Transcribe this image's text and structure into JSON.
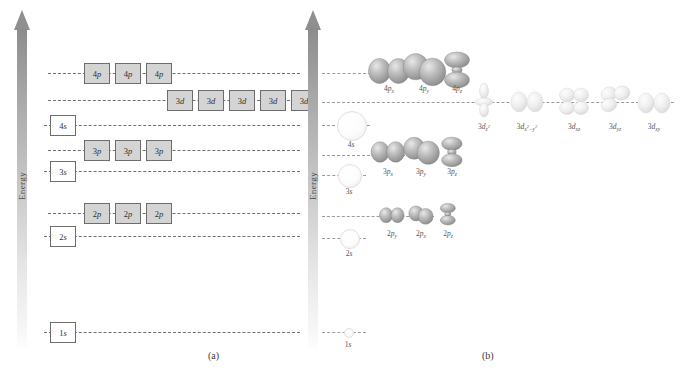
{
  "figure": {
    "panel_a": {
      "caption": "(a)",
      "axis_label": "Energy",
      "levels": [
        {
          "id": "4p",
          "label": "4p",
          "n": "4",
          "l": "p",
          "boxes": 3,
          "filled": true,
          "y": 73,
          "box_start_x": 84,
          "line_x": 48,
          "line_w": 252
        },
        {
          "id": "3d",
          "label": "3d",
          "n": "3",
          "l": "d",
          "boxes": 5,
          "filled": true,
          "y": 100,
          "box_start_x": 167,
          "line_x": 48,
          "line_w": 252
        },
        {
          "id": "4s",
          "label": "4s",
          "n": "4",
          "l": "s",
          "boxes": 1,
          "filled": false,
          "y": 125,
          "box_start_x": 50,
          "line_x": 44,
          "line_w": 256
        },
        {
          "id": "3p",
          "label": "3p",
          "n": "3",
          "l": "p",
          "boxes": 3,
          "filled": true,
          "y": 150,
          "box_start_x": 84,
          "line_x": 48,
          "line_w": 252
        },
        {
          "id": "3s",
          "label": "3s",
          "n": "3",
          "l": "s",
          "boxes": 1,
          "filled": false,
          "y": 171,
          "box_start_x": 50,
          "line_x": 44,
          "line_w": 256
        },
        {
          "id": "2p",
          "label": "2p",
          "n": "2",
          "l": "p",
          "boxes": 3,
          "filled": true,
          "y": 213,
          "box_start_x": 84,
          "line_x": 48,
          "line_w": 252
        },
        {
          "id": "2s",
          "label": "2s",
          "n": "2",
          "l": "s",
          "boxes": 1,
          "filled": false,
          "y": 236,
          "box_start_x": 50,
          "line_x": 44,
          "line_w": 256
        },
        {
          "id": "1s",
          "label": "1s",
          "n": "1",
          "l": "s",
          "boxes": 1,
          "filled": false,
          "y": 332,
          "box_start_x": 50,
          "line_x": 44,
          "line_w": 256
        }
      ]
    },
    "panel_b": {
      "caption": "(b)",
      "axis_label": "Energy",
      "levels": [
        {
          "id": "4p",
          "y": 73,
          "line_x": 322,
          "line_w": 80
        },
        {
          "id": "3d",
          "y": 102,
          "line_x": 322,
          "line_w": 352
        },
        {
          "id": "4s",
          "y": 125,
          "line_x": 322,
          "line_w": 48
        },
        {
          "id": "3p",
          "y": 155,
          "line_x": 322,
          "line_w": 108
        },
        {
          "id": "3s",
          "y": 175,
          "line_x": 322,
          "line_w": 44
        },
        {
          "id": "2p",
          "y": 216,
          "line_x": 322,
          "line_w": 112
        },
        {
          "id": "2s",
          "y": 238,
          "line_x": 322,
          "line_w": 44
        },
        {
          "id": "1s",
          "y": 332,
          "line_x": 322,
          "line_w": 44
        }
      ],
      "s_orbitals": [
        {
          "id": "4s",
          "label": "4s",
          "n": "4",
          "cx": 351,
          "cy": 125,
          "r": 14,
          "label_y": 140
        },
        {
          "id": "3s",
          "label": "3s",
          "n": "3",
          "cx": 349,
          "cy": 175,
          "r": 11,
          "label_y": 187
        },
        {
          "id": "2s",
          "label": "2s",
          "n": "2",
          "cx": 349,
          "cy": 238,
          "r": 9,
          "label_y": 249
        },
        {
          "id": "1s",
          "label": "1s",
          "n": "1",
          "cx": 348,
          "cy": 332,
          "r": 4,
          "label_y": 340
        }
      ],
      "p_orbitals": [
        {
          "id": "4px",
          "n": "4",
          "l": "p",
          "sub": "x",
          "cx": 389,
          "cy": 71,
          "scale": 1.0,
          "shape": "p-horizontal",
          "label_y": 84
        },
        {
          "id": "4py",
          "n": "4",
          "l": "p",
          "sub": "y",
          "cx": 424,
          "cy": 70,
          "scale": 1.05,
          "shape": "p-oblique",
          "label_y": 84
        },
        {
          "id": "4pz",
          "n": "4",
          "l": "p",
          "sub": "z",
          "cx": 457,
          "cy": 70,
          "scale": 1.0,
          "shape": "p-vertical",
          "label_y": 84
        },
        {
          "id": "3px",
          "n": "3",
          "l": "p",
          "sub": "x",
          "cx": 388,
          "cy": 152,
          "scale": 0.82,
          "shape": "p-horizontal",
          "label_y": 167
        },
        {
          "id": "3py",
          "n": "3",
          "l": "p",
          "sub": "y",
          "cx": 421,
          "cy": 151,
          "scale": 0.88,
          "shape": "p-oblique",
          "label_y": 167
        },
        {
          "id": "3pz",
          "n": "3",
          "l": "p",
          "sub": "z",
          "cx": 452,
          "cy": 152,
          "scale": 0.82,
          "shape": "p-vertical",
          "label_y": 167
        },
        {
          "id": "2py",
          "n": "2",
          "l": "p",
          "sub": "y",
          "cx": 392,
          "cy": 215,
          "scale": 0.6,
          "shape": "p-horizontal",
          "label_y": 229
        },
        {
          "id": "2px",
          "n": "2",
          "l": "p",
          "sub": "x",
          "cx": 421,
          "cy": 215,
          "scale": 0.6,
          "shape": "p-oblique",
          "label_y": 229
        },
        {
          "id": "2pz",
          "n": "2",
          "l": "p",
          "sub": "z",
          "cx": 448,
          "cy": 214,
          "scale": 0.6,
          "shape": "p-vertical",
          "label_y": 229
        }
      ],
      "d_orbitals": [
        {
          "id": "3dz2",
          "n": "3",
          "l": "d",
          "sub": "z2",
          "cx": 484,
          "cy": 100,
          "shape": "d-z2",
          "label_y": 122
        },
        {
          "id": "3dx2y2",
          "n": "3",
          "l": "d",
          "sub": "x2-y2",
          "cx": 527,
          "cy": 102,
          "shape": "d-lobes-h",
          "label_y": 122
        },
        {
          "id": "3dxz",
          "n": "3",
          "l": "d",
          "sub": "xz",
          "cx": 574,
          "cy": 102,
          "shape": "d-clover",
          "label_y": 122
        },
        {
          "id": "3dyz",
          "n": "3",
          "l": "d",
          "sub": "yz",
          "cx": 615,
          "cy": 100,
          "shape": "d-clover2",
          "label_y": 122
        },
        {
          "id": "3dxy",
          "n": "3",
          "l": "d",
          "sub": "xy",
          "cx": 654,
          "cy": 103,
          "shape": "d-lobes-h",
          "label_y": 122
        }
      ]
    }
  },
  "colors": {
    "line": "#6f6f6f",
    "box_border": "#6d6d6d",
    "box_fill": "#d4d4d4",
    "arrow_top": "#8c8c8c",
    "text": "#3a3a3a"
  }
}
